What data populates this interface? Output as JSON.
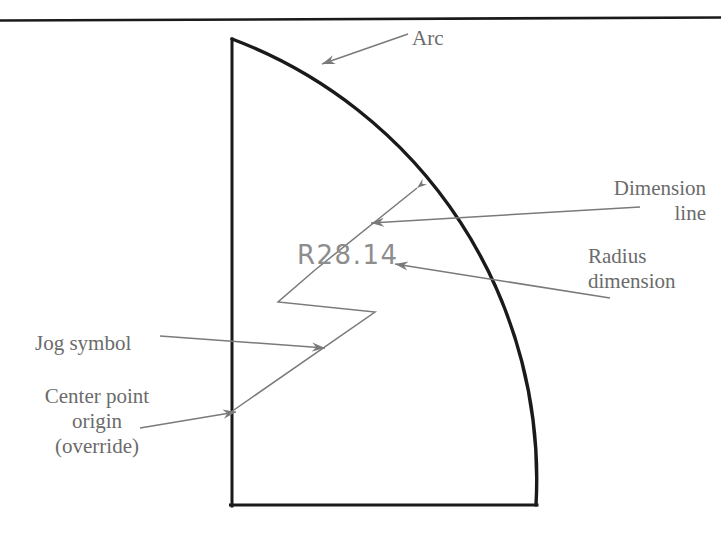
{
  "figure": {
    "top_rule": true,
    "geometry": {
      "shape": "quarter-arc profile with vertical left edge and horizontal bottom edge",
      "top_left_corner": [
        231,
        39
      ],
      "bottom_left_corner": [
        231,
        506
      ],
      "bottom_right_corner": [
        536,
        506
      ],
      "arc_start": [
        231,
        39
      ],
      "arc_end": [
        536,
        506
      ],
      "arc_radius_px": 470,
      "outline_color": "#1a1a1a",
      "outline_width": 3
    },
    "annotation_color": "#7a7a7a",
    "dimension_text_color": "#8d8d8d"
  },
  "dimension": {
    "radius_value": "R28.14"
  },
  "callouts": [
    {
      "id": "arc",
      "label": "Arc"
    },
    {
      "id": "dimension",
      "line1": "Dimension",
      "line2": "line"
    },
    {
      "id": "radius",
      "line1": "Radius",
      "line2": "dimension"
    },
    {
      "id": "jog",
      "label": "Jog symbol"
    },
    {
      "id": "center_point",
      "line1": "Center point",
      "line2": "origin",
      "line3": "(override)"
    }
  ]
}
